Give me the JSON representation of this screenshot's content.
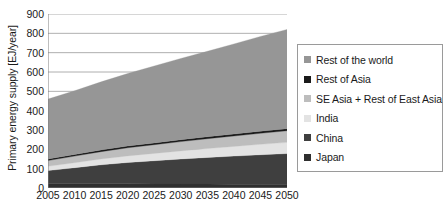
{
  "chart_data": {
    "type": "area",
    "stacked": true,
    "title": "",
    "xlabel": "",
    "ylabel": "Primary energy supply [EJ/year]",
    "x": [
      2005,
      2010,
      2015,
      2020,
      2025,
      2030,
      2035,
      2040,
      2045,
      2050
    ],
    "xlim": [
      2005,
      2050
    ],
    "ylim": [
      0,
      900
    ],
    "ytick_step": 100,
    "yticks": [
      900,
      800,
      700,
      600,
      500,
      400,
      300,
      200,
      100,
      0
    ],
    "xticks": [
      2005,
      2010,
      2015,
      2020,
      2025,
      2030,
      2035,
      2040,
      2045,
      2050
    ],
    "grid": true,
    "grid_axis": "y",
    "legend_position": "right",
    "stack_order_bottom_to_top": [
      "Japan",
      "China",
      "India",
      "SE Asia + Rest of East Asia",
      "Rest of Asia",
      "Rest of the world"
    ],
    "series": [
      {
        "name": "Japan",
        "color": "#2f2f2f",
        "values": [
          22,
          22,
          22,
          22,
          21,
          21,
          21,
          20,
          20,
          20
        ]
      },
      {
        "name": "China",
        "color": "#3f3f3f",
        "values": [
          68,
          83,
          98,
          110,
          120,
          129,
          137,
          145,
          152,
          158
        ]
      },
      {
        "name": "India",
        "color": "#e3e3e3",
        "values": [
          22,
          26,
          30,
          34,
          38,
          42,
          46,
          50,
          54,
          58
        ]
      },
      {
        "name": "SE Asia + Rest of East Asia",
        "color": "#bdbdbd",
        "values": [
          30,
          34,
          38,
          42,
          45,
          48,
          51,
          54,
          57,
          60
        ]
      },
      {
        "name": "Rest of Asia",
        "color": "#1a1a1a",
        "values": [
          8,
          8,
          9,
          9,
          9,
          10,
          10,
          10,
          11,
          11
        ]
      },
      {
        "name": "Rest of the world",
        "color": "#969696",
        "values": [
          310,
          330,
          352,
          375,
          398,
          420,
          442,
          466,
          490,
          513
        ]
      }
    ],
    "totals": [
      460,
      503,
      549,
      592,
      631,
      670,
      707,
      745,
      784,
      820
    ],
    "annotations": []
  },
  "axis": {
    "y_title": "Primary energy supply [EJ/year]",
    "y_ticks": [
      "900",
      "800",
      "700",
      "600",
      "500",
      "400",
      "300",
      "200",
      "100",
      "0"
    ],
    "x_ticks": [
      "2005",
      "2010",
      "2015",
      "2020",
      "2025",
      "2030",
      "2035",
      "2040",
      "2045",
      "2050"
    ]
  },
  "legend": {
    "items": [
      {
        "label": "Rest of the world",
        "color": "#969696"
      },
      {
        "label": "Rest of Asia",
        "color": "#1a1a1a"
      },
      {
        "label": "SE Asia + Rest of East Asia",
        "color": "#bdbdbd"
      },
      {
        "label": "India",
        "color": "#e3e3e3"
      },
      {
        "label": "China",
        "color": "#3f3f3f"
      },
      {
        "label": "Japan",
        "color": "#2f2f2f"
      }
    ]
  },
  "colors": {
    "axis": "#7f7f7f",
    "grid": "#9a9a9a",
    "text": "#1a1a1a",
    "background": "#ffffff",
    "legend_border": "#9a9a9a"
  }
}
